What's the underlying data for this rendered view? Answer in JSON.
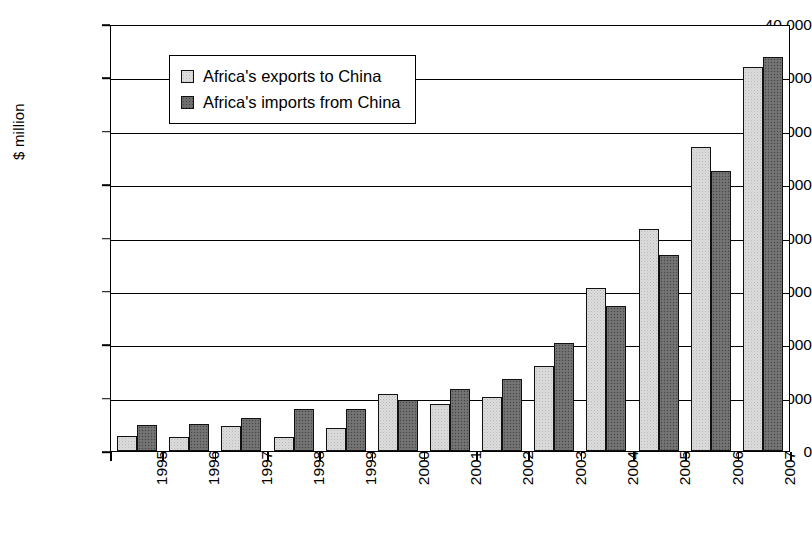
{
  "chart_data": {
    "type": "bar",
    "title": "",
    "xlabel": "",
    "ylabel": "$ million",
    "ylim": [
      0,
      40000
    ],
    "ytick_labels": [
      "40,000",
      "35,000",
      "30,000",
      "25,000",
      "20,000",
      "15,000",
      "10,000",
      "5,000",
      "0"
    ],
    "ytick_values": [
      40000,
      35000,
      30000,
      25000,
      20000,
      15000,
      10000,
      5000,
      0
    ],
    "grid": true,
    "legend_position": "top-left inside",
    "categories": [
      "1995",
      "1996",
      "1997",
      "1998",
      "1999",
      "2000",
      "2001",
      "2002",
      "2003",
      "2004",
      "2005",
      "2006",
      "2007"
    ],
    "series": [
      {
        "name": "Africa's exports to China",
        "color": "#dcdcdc",
        "values": [
          1400,
          1350,
          2350,
          1300,
          2200,
          5300,
          4400,
          5100,
          8000,
          15300,
          20800,
          28500,
          36000
        ]
      },
      {
        "name": "Africa's imports from China",
        "color": "#6e6e6e",
        "values": [
          2400,
          2500,
          3100,
          3900,
          3900,
          4800,
          5800,
          6700,
          10100,
          13600,
          18400,
          26200,
          36900
        ]
      }
    ]
  }
}
